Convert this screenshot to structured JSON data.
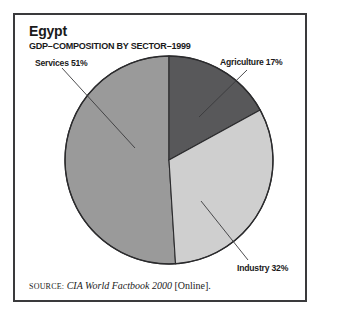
{
  "header": {
    "title": "Egypt",
    "subtitle": "GDP–COMPOSITION BY SECTOR–1999"
  },
  "source": {
    "label": "SOURCE:",
    "citation": "CIA World Factbook 2000",
    "suffix": "[Online]."
  },
  "colors": {
    "agriculture": "#58585a",
    "industry": "#cfcfcf",
    "services": "#9a9a9a",
    "outline": "#2b2b2d",
    "frame": "#3a3a3c",
    "text": "#1a1a1a",
    "background": "#ffffff"
  },
  "chart_data": {
    "type": "pie",
    "title": "Egypt",
    "subtitle": "GDP–COMPOSITION BY SECTOR–1999",
    "categories": [
      "Agriculture",
      "Industry",
      "Services"
    ],
    "values": [
      17,
      32,
      51
    ],
    "unit": "%",
    "labels": [
      {
        "name": "Agriculture",
        "value": 17,
        "text": "Agriculture 17%",
        "position": "upper-right"
      },
      {
        "name": "Industry",
        "value": 32,
        "text": "Industry 32%",
        "position": "lower-right"
      },
      {
        "name": "Services",
        "value": 51,
        "text": "Services 51%",
        "position": "upper-left"
      }
    ],
    "colors": [
      "#58585a",
      "#cfcfcf",
      "#9a9a9a"
    ],
    "start_angle": 0,
    "direction": "clockwise",
    "legend": "none",
    "grid": false,
    "annotations": [
      "leader lines from each label to its slice"
    ]
  },
  "labels": {
    "agriculture": "Agriculture 17%",
    "industry": "Industry 32%",
    "services": "Services 51%"
  }
}
